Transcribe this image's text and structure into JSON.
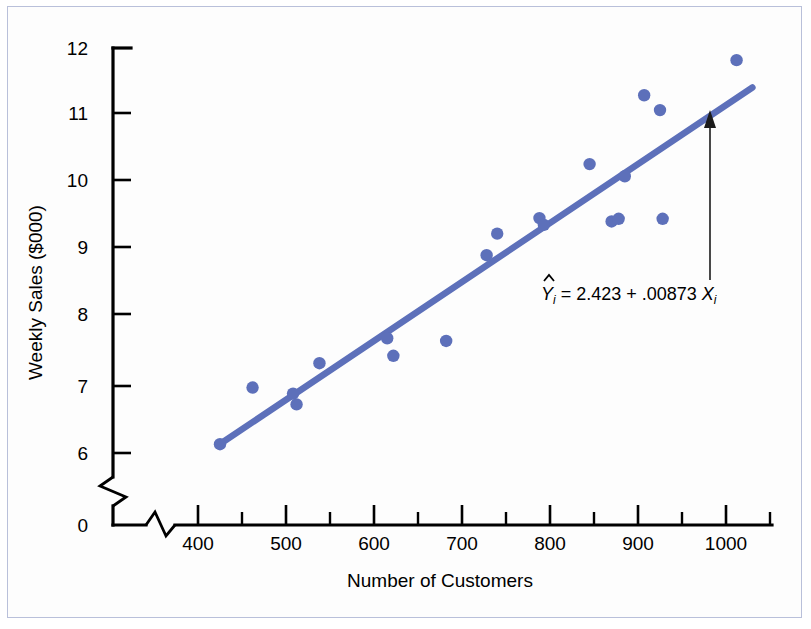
{
  "chart_data": {
    "type": "scatter",
    "title": "",
    "xlabel": "Number of Customers",
    "ylabel": "Weekly Sales ($000)",
    "xlim": [
      370,
      1050
    ],
    "ylim": [
      5.7,
      12.1
    ],
    "x_ticks": [
      400,
      500,
      600,
      700,
      800,
      900,
      1000
    ],
    "x_tick_labels": [
      "400",
      "500",
      "600",
      "700",
      "800",
      "900",
      "1000"
    ],
    "x_minor_ticks": [
      450,
      550,
      650,
      750,
      850,
      950,
      1050
    ],
    "y_ticks": [
      6,
      7,
      8,
      9,
      10,
      11,
      12
    ],
    "y_tick_labels": [
      "6",
      "7",
      "8",
      "9",
      "10",
      "11",
      "12"
    ],
    "y_origin_label": "0",
    "y_axis_break": true,
    "grid": false,
    "legend": false,
    "series": [
      {
        "name": "Weekly Sales vs Number of Customers",
        "marker": "circle",
        "color": "#5d70ba",
        "points": [
          {
            "x": 425,
            "y": 6.13
          },
          {
            "x": 462,
            "y": 6.97
          },
          {
            "x": 508,
            "y": 6.88
          },
          {
            "x": 512,
            "y": 6.72
          },
          {
            "x": 538,
            "y": 7.33
          },
          {
            "x": 615,
            "y": 7.7
          },
          {
            "x": 622,
            "y": 7.44
          },
          {
            "x": 682,
            "y": 7.66
          },
          {
            "x": 728,
            "y": 8.93
          },
          {
            "x": 740,
            "y": 9.25
          },
          {
            "x": 788,
            "y": 9.48
          },
          {
            "x": 793,
            "y": 9.38
          },
          {
            "x": 845,
            "y": 10.28
          },
          {
            "x": 870,
            "y": 9.43
          },
          {
            "x": 878,
            "y": 9.47
          },
          {
            "x": 885,
            "y": 10.1
          },
          {
            "x": 907,
            "y": 11.3
          },
          {
            "x": 925,
            "y": 11.08
          },
          {
            "x": 928,
            "y": 9.47
          },
          {
            "x": 1012,
            "y": 11.82
          }
        ]
      }
    ],
    "fit_line": {
      "label": "regression-line",
      "color": "#5d70ba",
      "intercept": 2.423,
      "slope": 0.00873,
      "x_start": 425,
      "x_end": 1030
    },
    "annotations": [
      {
        "name": "regression-equation",
        "text": "Ŷi = 2.423 + .00873 Xi",
        "parts": {
          "y_hat": "Y",
          "sub_i_1": "i",
          "body": " = 2.423 + .00873 ",
          "x_sym": "X",
          "sub_i_2": "i"
        },
        "pointer": "arrow-up-to-regression-line"
      }
    ]
  }
}
